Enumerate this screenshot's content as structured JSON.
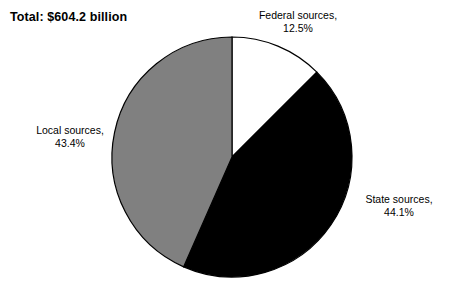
{
  "chart_data": {
    "type": "pie",
    "title": "Total: $604.2 billion",
    "categories": [
      "Federal sources",
      "State sources",
      "Local sources"
    ],
    "values": [
      12.5,
      44.1,
      43.4
    ],
    "value_unit": "percent",
    "total_label": "Total: $604.2 billion",
    "total_value": 604.2,
    "total_unit": "billion dollars",
    "start_angle_deg": 0,
    "direction": "clockwise",
    "legend": "none",
    "labels_inline": true,
    "slices": [
      {
        "name": "Federal sources",
        "percent": 12.5,
        "percent_text": "12.5%",
        "label_line1": "Federal sources,",
        "label_line2": "12.5%",
        "color": "#ffffff",
        "stroke": "#000000",
        "start_deg": 0,
        "end_deg": 45.0
      },
      {
        "name": "State sources",
        "percent": 44.1,
        "percent_text": "44.1%",
        "label_line1": "State sources,",
        "label_line2": "44.1%",
        "color": "#000000",
        "stroke": "#000000",
        "start_deg": 45.0,
        "end_deg": 203.76
      },
      {
        "name": "Local sources",
        "percent": 43.4,
        "percent_text": "43.4%",
        "label_line1": "Local sources,",
        "label_line2": "43.4%",
        "color": "#808080",
        "stroke": "#000000",
        "start_deg": 203.76,
        "end_deg": 360.0
      }
    ],
    "geometry": {
      "center_x": 232,
      "center_y": 157,
      "radius": 120
    },
    "xlabel": "",
    "ylabel": ""
  }
}
